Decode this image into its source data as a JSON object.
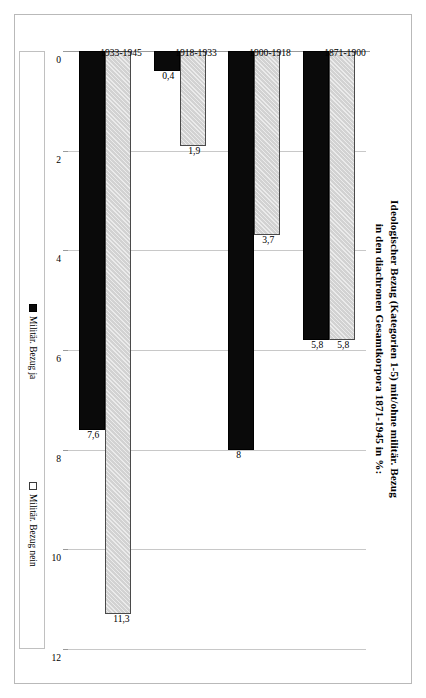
{
  "chart_data": {
    "type": "bar",
    "orientation": "horizontal",
    "title": "Ideologischer Bezug (Kategorien 1-5) mit/ohne militär. Bezug",
    "title_line2": "in den diachronen Gesamtkorpora 1871-1945 in %:",
    "categories": [
      "1871-1900",
      "1900-1918",
      "1918-1933",
      "1933-1945"
    ],
    "series": [
      {
        "name": "Militär. Bezug ja",
        "color": "#0a0a0a",
        "values": [
          5.8,
          8,
          0.4,
          7.6
        ],
        "labels": [
          "5,8",
          "8",
          "0,4",
          "7,6"
        ]
      },
      {
        "name": "Militär. Bezug nein",
        "color": "#d2d2d2",
        "values": [
          5.8,
          3.7,
          1.9,
          11.3
        ],
        "labels": [
          "5,8",
          "3,7",
          "1,9",
          "11,3"
        ]
      }
    ],
    "xlabel": "",
    "ylabel": "",
    "xlim": [
      0,
      12
    ],
    "xticks": [
      0,
      2,
      4,
      6,
      8,
      10,
      12
    ],
    "xtick_labels": [
      "0",
      "2",
      "4",
      "6",
      "8",
      "10",
      "12"
    ],
    "grid": true,
    "grid_axis": "x",
    "legend_position": "bottom"
  },
  "legend": {
    "items": [
      {
        "label": "Militär. Bezug ja",
        "swatch": "ja"
      },
      {
        "label": "Militär. Bezug nein",
        "swatch": "nein"
      }
    ]
  }
}
